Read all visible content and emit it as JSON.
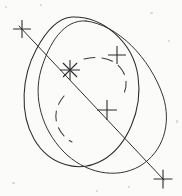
{
  "figure": {
    "background_color": "#fbfbfa",
    "ink_color": "#2b2b2b",
    "width": 182,
    "height": 196
  },
  "chart_data": {
    "type": "scatter",
    "title": "",
    "xlabel": "",
    "ylabel": "",
    "xlim": [
      0,
      182
    ],
    "ylim": [
      0,
      196
    ],
    "grid": false,
    "legend": null,
    "markers": [
      {
        "name": "cross-top-left",
        "glyph": "plus",
        "x": 22,
        "y": 29,
        "size": 17
      },
      {
        "name": "star-center",
        "glyph": "asterisk",
        "x": 70,
        "y": 70,
        "size": 19
      },
      {
        "name": "cross-upper-right",
        "glyph": "plus",
        "x": 117,
        "y": 55,
        "size": 17
      },
      {
        "name": "cross-mid-right",
        "glyph": "plus",
        "x": 107,
        "y": 110,
        "size": 19
      },
      {
        "name": "cross-bottom-right",
        "glyph": "plus",
        "x": 163,
        "y": 179,
        "size": 18
      }
    ],
    "ellipses": [
      {
        "name": "outer-ellipse-upper",
        "style": "solid",
        "cx": 85,
        "cy": 92,
        "rx": 52,
        "ry": 68,
        "rotation_deg": 28
      },
      {
        "name": "outer-ellipse-lower",
        "style": "solid",
        "cx": 94,
        "cy": 98,
        "rx": 50,
        "ry": 70,
        "rotation_deg": 40
      },
      {
        "name": "inner-ellipse-dashed",
        "style": "dashed",
        "cx": 88,
        "cy": 90,
        "rx": 28,
        "ry": 42,
        "rotation_deg": 30,
        "visible_arcs": [
          "upper-right",
          "lower-left"
        ]
      }
    ],
    "lines": [
      {
        "name": "major-axis-line",
        "style": "solid",
        "x1": 19,
        "y1": 26,
        "x2": 164,
        "y2": 180
      }
    ]
  }
}
